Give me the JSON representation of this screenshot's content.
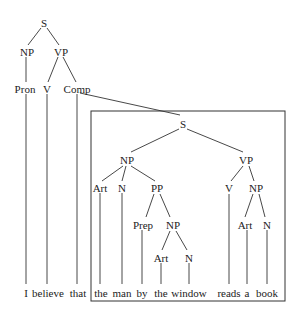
{
  "diagram": {
    "type": "syntax-tree",
    "root": {
      "label": "S",
      "children": [
        {
          "label": "NP",
          "children": [
            {
              "label": "Pron",
              "word": "I"
            }
          ]
        },
        {
          "label": "VP",
          "children": [
            {
              "label": "V",
              "word": "believe"
            },
            {
              "label": "Comp",
              "word": "that"
            }
          ]
        }
      ]
    },
    "embedded": {
      "label": "S",
      "children": [
        {
          "label": "NP",
          "children": [
            {
              "label": "Art",
              "word": "the"
            },
            {
              "label": "N",
              "word": "man"
            },
            {
              "label": "PP",
              "children": [
                {
                  "label": "Prep",
                  "word": "by"
                },
                {
                  "label": "NP",
                  "children": [
                    {
                      "label": "Art",
                      "word": "the"
                    },
                    {
                      "label": "N",
                      "word": "window"
                    }
                  ]
                }
              ]
            }
          ]
        },
        {
          "label": "VP",
          "children": [
            {
              "label": "V",
              "word": "reads"
            },
            {
              "label": "NP",
              "children": [
                {
                  "label": "Art",
                  "word": "a"
                },
                {
                  "label": "N",
                  "word": "book"
                }
              ]
            }
          ]
        }
      ]
    }
  },
  "nodes": {
    "s_top": "S",
    "np_top": "NP",
    "vp_top": "VP",
    "pron": "Pron",
    "v_top": "V",
    "comp": "Comp",
    "s_inner": "S",
    "np_subj": "NP",
    "vp_inner": "VP",
    "art1": "Art",
    "n1": "N",
    "pp": "PP",
    "v_inner": "V",
    "np_obj": "NP",
    "prep": "Prep",
    "np_pp": "NP",
    "art_obj": "Art",
    "n_obj": "N",
    "art2": "Art",
    "n2": "N"
  },
  "words": [
    "I",
    "believe",
    "that",
    "the",
    "man",
    "by",
    "the",
    "window",
    "reads",
    "a",
    "book"
  ]
}
